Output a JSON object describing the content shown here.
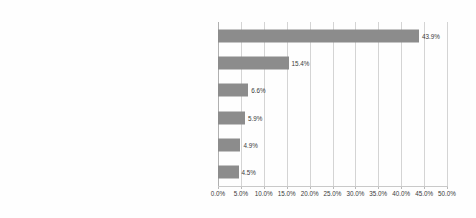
{
  "chart_data": {
    "type": "bar",
    "orientation": "horizontal",
    "title": "",
    "subtitle": "",
    "xlabel": "",
    "ylabel": "",
    "xlim": [
      0,
      50
    ],
    "grid": true,
    "legend": false,
    "value_suffix": "%",
    "categories": [
      "Making new business contacts in the area of distribution",
      "Making business contacts",
      "Better understanding of environmental policy",
      "Avoidance of penalties for failure to comply with regulations",
      "Reduction in distribution costs",
      "Gaining competitive advantage"
    ],
    "values": [
      43.9,
      15.4,
      6.6,
      5.9,
      4.9,
      4.5
    ],
    "data_labels": [
      "43.9%",
      "15.4%",
      "6.6%",
      "5.9%",
      "4.9%",
      "4.5%"
    ],
    "xticks": [
      0,
      5,
      10,
      15,
      20,
      25,
      30,
      35,
      40,
      45,
      50
    ],
    "xtick_labels": [
      "0.0%",
      "5.0%",
      "10.0%",
      "15.0%",
      "20.0%",
      "25.0%",
      "30.0%",
      "35.0%",
      "40.0%",
      "45.0%",
      "50.0%"
    ],
    "colors": {
      "bar": "#8c8c8c",
      "gridline": "#d4d4d4",
      "axis": "#b0b0b0",
      "text": "#3a3a3a",
      "background": "#fefefe"
    }
  }
}
